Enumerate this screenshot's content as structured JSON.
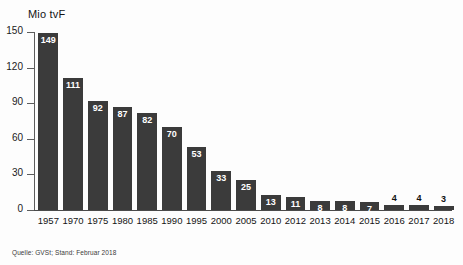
{
  "chart_data": {
    "type": "bar",
    "title": "",
    "ylabel": "Mio tvF",
    "xlabel": "",
    "ylim": [
      0,
      150
    ],
    "yticks": [
      0,
      30,
      60,
      90,
      120,
      150
    ],
    "grid": false,
    "legend": null,
    "source_note": "Quelle: GVSt; Stand: Februar 2018",
    "categories": [
      "1957",
      "1970",
      "1975",
      "1980",
      "1985",
      "1990",
      "1995",
      "2000",
      "2005",
      "2010",
      "2012",
      "2013",
      "2014",
      "2015",
      "2016",
      "2017",
      "2018"
    ],
    "values": [
      149,
      111,
      92,
      87,
      82,
      70,
      53,
      33,
      25,
      13,
      11,
      8,
      8,
      7,
      4,
      4,
      3
    ],
    "label_placement": [
      "inside",
      "inside",
      "inside",
      "inside",
      "inside",
      "inside",
      "inside",
      "inside",
      "inside",
      "inside",
      "inside",
      "inside",
      "inside",
      "inside",
      "outside",
      "outside",
      "outside"
    ],
    "bar_color": "#3b3b3b",
    "label_color_inside": "#ffffff",
    "label_color_outside": "#111111",
    "background_color": "#fdfdfd"
  }
}
